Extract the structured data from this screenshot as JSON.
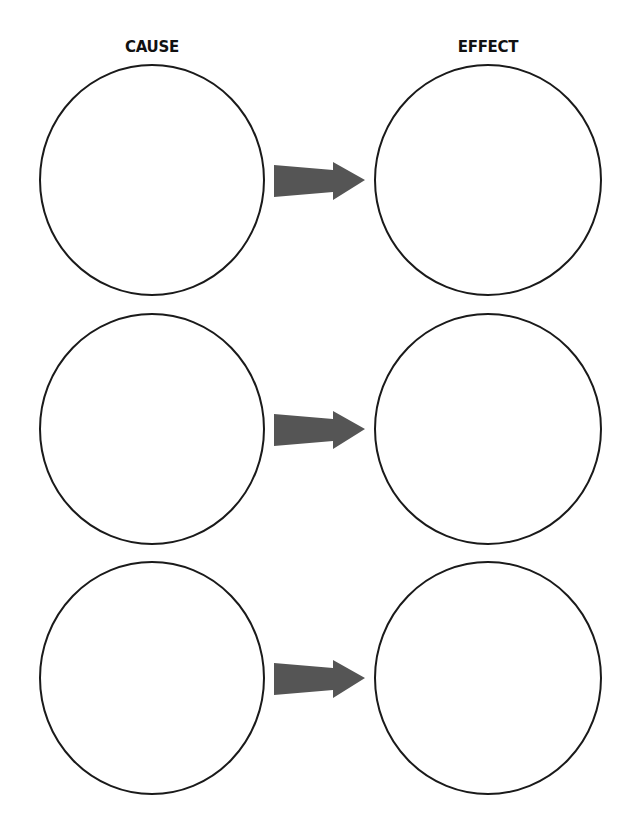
{
  "headings": {
    "cause": "CAUSE",
    "effect": "EFFECT"
  },
  "colors": {
    "circle_stroke": "#1a1a1a",
    "arrow_fill": "#555555",
    "background": "#ffffff"
  },
  "rows": [
    {
      "cause_text": "",
      "effect_text": ""
    },
    {
      "cause_text": "",
      "effect_text": ""
    },
    {
      "cause_text": "",
      "effect_text": ""
    }
  ]
}
